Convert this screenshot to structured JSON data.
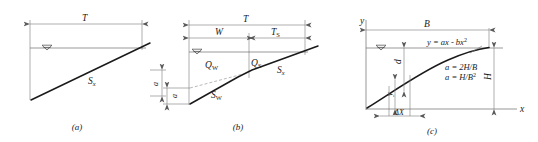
{
  "figure": {
    "panels": [
      {
        "id": "a",
        "caption": "(a)",
        "labels": {
          "spread": "T",
          "cross_slope": "S",
          "cross_slope_sub": "x",
          "depth": "a"
        }
      },
      {
        "id": "b",
        "caption": "(b)",
        "labels": {
          "spread": "T",
          "gutter_width": "W",
          "spread_section": "T",
          "spread_section_sub": "S",
          "flow_gutter": "Q",
          "flow_gutter_sub": "W",
          "flow_section": "Q",
          "flow_section_sub": "S",
          "slope_gutter": "S",
          "slope_gutter_sub": "W",
          "slope_cross": "S",
          "slope_cross_sub": "x",
          "depth": "a"
        }
      },
      {
        "id": "c",
        "caption": "(c)",
        "labels": {
          "y_axis": "y",
          "x_axis": "x",
          "width": "B",
          "height": "H",
          "depth_d": "d",
          "depth_y": "y",
          "delta_x": "ΔX",
          "equation": "y = ax - bx",
          "equation_exp": "2",
          "coef_a": "a = 2H/B",
          "coef_b": "a = H/B",
          "coef_b_exp": "2"
        }
      }
    ]
  },
  "colors": {
    "line_dark": "#1a1a1a",
    "line_thin": "#7a7a7a",
    "background": "#ffffff"
  }
}
